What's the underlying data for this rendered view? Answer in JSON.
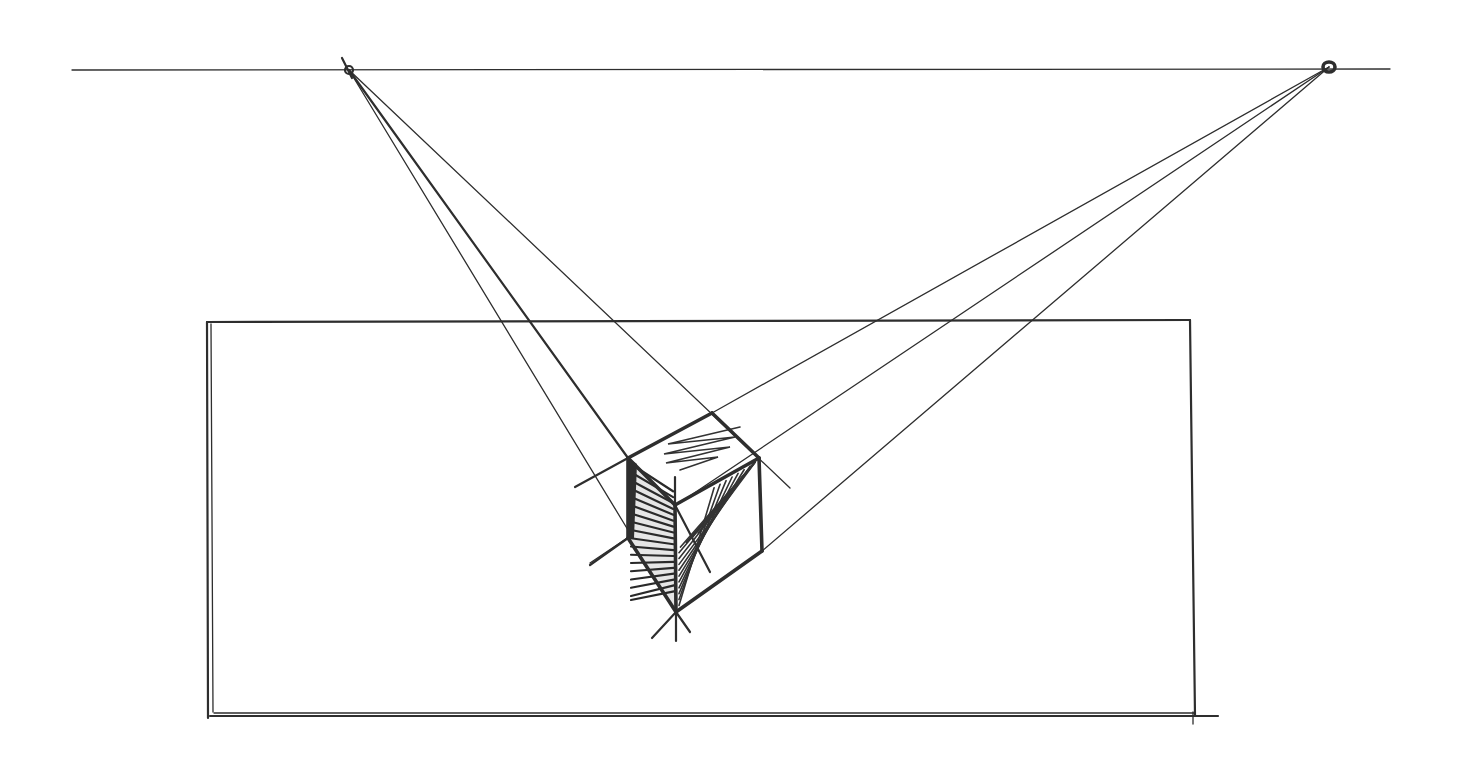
{
  "title": "Two-point perspective cube sketch",
  "colors": {
    "paper": "#ffffff",
    "ink": "#2e2e2e"
  },
  "horizon": {
    "x1": 72,
    "y1": 70,
    "x2": 1390,
    "y2": 69
  },
  "vanishing_points": {
    "left": {
      "x": 349,
      "y": 70
    },
    "right": {
      "x": 1329,
      "y": 67
    }
  },
  "picture_frame": {
    "top_left": {
      "x": 207,
      "y": 322
    },
    "top_right": {
      "x": 1190,
      "y": 320
    },
    "bottom_right": {
      "x": 1195,
      "y": 716
    },
    "bottom_left": {
      "x": 210,
      "y": 716
    },
    "bottom_overshoot_x": 1218
  },
  "cube": {
    "vertices": {
      "top_left": {
        "x": 628,
        "y": 458
      },
      "top_back": {
        "x": 712,
        "y": 413
      },
      "top_right": {
        "x": 759,
        "y": 458
      },
      "front_top": {
        "x": 675,
        "y": 505
      },
      "left_bottom": {
        "x": 628,
        "y": 538
      },
      "front_bottom": {
        "x": 676,
        "y": 612
      },
      "right_bottom": {
        "x": 762,
        "y": 551
      }
    },
    "faces": {
      "top": "light zigzag scribble",
      "left": "dense dark hatching",
      "right": "diagonal hatching"
    }
  },
  "construction_lines": {
    "from_left_vp": [
      {
        "to": {
          "x": 628,
          "y": 530
        },
        "weight": "thin"
      },
      {
        "to": {
          "x": 628,
          "y": 458
        },
        "weight": "med"
      },
      {
        "to": {
          "x": 790,
          "y": 488
        },
        "weight": "thin"
      }
    ],
    "from_right_vp": [
      {
        "to": {
          "x": 712,
          "y": 413
        },
        "weight": "thin"
      },
      {
        "to": {
          "x": 590,
          "y": 563
        },
        "weight": "thin"
      },
      {
        "to": {
          "x": 762,
          "y": 551
        },
        "weight": "thin"
      }
    ],
    "extensions": [
      {
        "from": {
          "x": 628,
          "y": 458
        },
        "to": {
          "x": 575,
          "y": 487
        }
      },
      {
        "from": {
          "x": 628,
          "y": 538
        },
        "to": {
          "x": 590,
          "y": 565
        }
      },
      {
        "from": {
          "x": 675,
          "y": 505
        },
        "to": {
          "x": 675,
          "y": 477
        }
      },
      {
        "from": {
          "x": 676,
          "y": 612
        },
        "to": {
          "x": 652,
          "y": 638
        }
      },
      {
        "from": {
          "x": 676,
          "y": 612
        },
        "to": {
          "x": 676,
          "y": 641
        }
      },
      {
        "from": {
          "x": 676,
          "y": 612
        },
        "to": {
          "x": 690,
          "y": 632
        }
      },
      {
        "from": {
          "x": 675,
          "y": 505
        },
        "to": {
          "x": 710,
          "y": 572
        }
      }
    ]
  }
}
